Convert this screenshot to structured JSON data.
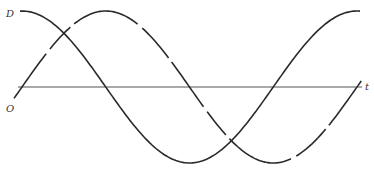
{
  "diagram": {
    "title": "",
    "labels": {
      "curve_d": "D",
      "curve_o": "O",
      "axis_t": "t"
    },
    "curves": [
      {
        "name": "D",
        "function": "cos",
        "style": "solid",
        "periods": 1
      },
      {
        "name": "O",
        "function": "sin",
        "style": "dashed",
        "periods": 1
      }
    ],
    "colors": {
      "ink": "#2a2a2a"
    }
  }
}
